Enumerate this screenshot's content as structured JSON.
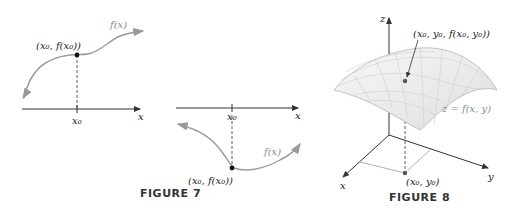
{
  "figure7": {
    "caption": "FIGURE 7",
    "left_panel": {
      "point_label": "(x₀, f(x₀))",
      "curve_label": "f(x)",
      "tick_label": "x₀",
      "axis_label": "x"
    },
    "right_panel": {
      "point_label": "(x₀, f(x₀))",
      "curve_label": "f(x)",
      "tick_label": "x₀",
      "axis_label": "x"
    }
  },
  "figure8": {
    "caption": "FIGURE 8",
    "z_axis_label": "z",
    "x_axis_label": "x",
    "y_axis_label": "y",
    "point_label": "(x₀, y₀, f(x₀, y₀))",
    "surface_label": "z = f(x, y)",
    "base_point_label": "(x₀, y₀)"
  },
  "colors": {
    "curve": "#9a9a9a",
    "axis": "#333333",
    "point": "#111111",
    "surface_fill": "#eeeeee",
    "surface_grid": "#c8c8c8"
  }
}
